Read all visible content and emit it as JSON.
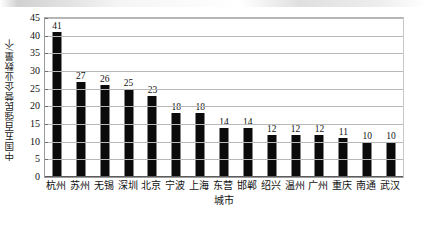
{
  "chart_data": {
    "type": "bar",
    "title": "",
    "subtitle": "",
    "xlabel": "城市",
    "ylabel": "中国五百强民营企业数量/个",
    "categories": [
      "杭州",
      "苏州",
      "无锡",
      "深圳",
      "北京",
      "宁波",
      "上海",
      "东营",
      "邯郸",
      "绍兴",
      "温州",
      "广州",
      "重庆",
      "南通",
      "武汉"
    ],
    "values": [
      41,
      27,
      26,
      25,
      23,
      18,
      18,
      14,
      14,
      12,
      12,
      12,
      11,
      10,
      10
    ],
    "ylim": [
      0,
      45
    ],
    "ytick_values": [
      0,
      5,
      10,
      15,
      20,
      25,
      30,
      35,
      40,
      45
    ],
    "ytick_labels": [
      "0",
      "5",
      "10",
      "15",
      "20",
      "25",
      "30",
      "35",
      "40",
      "45"
    ],
    "data_labels": [
      "41",
      "27",
      "26",
      "25",
      "23",
      "18",
      "18",
      "14",
      "14",
      "12",
      "12",
      "12",
      "11",
      "10",
      "10"
    ],
    "grid": true,
    "grid_axis": "y",
    "legend": false,
    "legend_position": "none",
    "bar_color": "#0b0b0b",
    "gridline_color": "#b8b8b8",
    "plot_border_color": "#9a9a9a",
    "background_color": "#ffffff"
  }
}
